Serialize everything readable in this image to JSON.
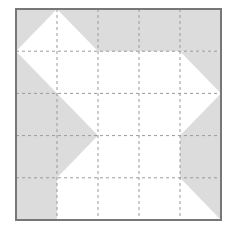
{
  "diagram": {
    "title": "",
    "grid": {
      "rows": 5,
      "cols": 5,
      "line_style": "dashed"
    },
    "colors": {
      "background": "#ffffff",
      "shaded": "#dcdcdc",
      "border": "#777777",
      "grid_line": "#9a9a9a"
    },
    "shaded_regions": [
      {
        "name": "top-band",
        "points_in_cells": [
          [
            0,
            0
          ],
          [
            1,
            0
          ],
          [
            5,
            0
          ],
          [
            5,
            1
          ],
          [
            4,
            1
          ],
          [
            5,
            2
          ],
          [
            4,
            3
          ],
          [
            4,
            4
          ],
          [
            5,
            5
          ],
          [
            5,
            0
          ]
        ],
        "description": "top row shaded except white triangle with apex at top of line x=1"
      }
    ],
    "shapes_in_cells": {
      "top_left_notch": [
        [
          0,
          0
        ],
        [
          1,
          0
        ],
        [
          0,
          1
        ]
      ],
      "top_band": [
        [
          1,
          0
        ],
        [
          5,
          0
        ],
        [
          5,
          1
        ],
        [
          4,
          1
        ],
        [
          2,
          1
        ]
      ],
      "left_block": [
        [
          0,
          1
        ],
        [
          2,
          3
        ],
        [
          1,
          4
        ],
        [
          1,
          5
        ],
        [
          0,
          5
        ]
      ],
      "right_block": [
        [
          4,
          1
        ],
        [
          5,
          1
        ],
        [
          5,
          2
        ],
        [
          4,
          3
        ],
        [
          4,
          4
        ],
        [
          5,
          5
        ],
        [
          5,
          2
        ]
      ]
    }
  }
}
